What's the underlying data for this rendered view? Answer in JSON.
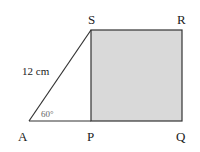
{
  "diagram": {
    "points": {
      "A": {
        "label": "A",
        "x": 29,
        "y": 121
      },
      "P": {
        "label": "P",
        "x": 91,
        "y": 121
      },
      "Q": {
        "label": "Q",
        "x": 182,
        "y": 121
      },
      "R": {
        "label": "R",
        "x": 182,
        "y": 30
      },
      "S": {
        "label": "S",
        "x": 91,
        "y": 30
      }
    },
    "side_label": "12 cm",
    "angle_label": "60°",
    "colors": {
      "square_fill": "#d9d9d9",
      "stroke": "#333333",
      "angle_text": "#666666"
    }
  }
}
